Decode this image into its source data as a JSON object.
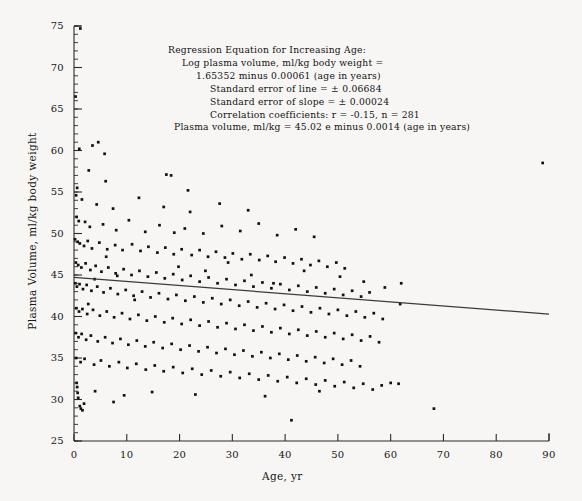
{
  "chart_data": {
    "type": "scatter",
    "title": "",
    "xlabel": "Age, yr",
    "ylabel": "Plasma Volume, ml/kg body weight",
    "xlim": [
      0,
      90
    ],
    "ylim": [
      25,
      75
    ],
    "xticks": [
      0,
      10,
      20,
      30,
      40,
      50,
      60,
      70,
      80,
      90
    ],
    "yticks": [
      25,
      30,
      35,
      40,
      45,
      50,
      55,
      60,
      65,
      70,
      75
    ],
    "grid": false,
    "legend": "none",
    "marker": "filled-square-dot",
    "marker_color": "#111111",
    "n_points_stated": 281,
    "annotations": [
      "Regression Equation for Increasing Age:",
      "Log plasma volume, ml/kg body weight =",
      "1.65352 minus 0.00061 (age in years)",
      "Standard error of line = ± 0.06684",
      "Standard error of slope = ± 0.00024",
      "Correlation coefficients:  r = -0.15, n = 281",
      "Plasma volume, ml/kg = 45.02 e minus 0.0014 (age in years)"
    ],
    "regression_line": {
      "label": "fitted regression line",
      "color": "#3b3b3b",
      "x": [
        0,
        90
      ],
      "y": [
        44.7,
        40.3
      ]
    },
    "points": [
      [
        1.2,
        74.7
      ],
      [
        0.3,
        66.5
      ],
      [
        1.0,
        60.2
      ],
      [
        3.5,
        60.6
      ],
      [
        4.6,
        61.0
      ],
      [
        5.8,
        59.6
      ],
      [
        88.8,
        58.5
      ],
      [
        2.8,
        57.6
      ],
      [
        6.0,
        56.3
      ],
      [
        17.5,
        57.1
      ],
      [
        18.4,
        57.0
      ],
      [
        21.6,
        55.2
      ],
      [
        0.6,
        55.5
      ],
      [
        0.4,
        54.6
      ],
      [
        1.5,
        54.1
      ],
      [
        4.3,
        53.5
      ],
      [
        7.4,
        53.0
      ],
      [
        12.3,
        54.3
      ],
      [
        17.0,
        53.2
      ],
      [
        22.0,
        52.6
      ],
      [
        27.6,
        53.6
      ],
      [
        33.0,
        52.8
      ],
      [
        0.5,
        52.0
      ],
      [
        0.9,
        51.5
      ],
      [
        2.1,
        51.4
      ],
      [
        3.0,
        50.8
      ],
      [
        5.5,
        51.1
      ],
      [
        8.0,
        50.4
      ],
      [
        10.4,
        51.6
      ],
      [
        13.5,
        50.2
      ],
      [
        16.2,
        51.0
      ],
      [
        19.0,
        50.1
      ],
      [
        21.0,
        50.6
      ],
      [
        24.5,
        50.0
      ],
      [
        28.0,
        50.9
      ],
      [
        31.5,
        50.3
      ],
      [
        35.0,
        51.2
      ],
      [
        38.5,
        49.8
      ],
      [
        42.0,
        50.5
      ],
      [
        45.5,
        49.6
      ],
      [
        0.2,
        49.3
      ],
      [
        0.7,
        49.0
      ],
      [
        1.1,
        48.8
      ],
      [
        1.9,
        48.5
      ],
      [
        2.6,
        49.1
      ],
      [
        3.4,
        48.2
      ],
      [
        4.8,
        48.9
      ],
      [
        6.3,
        48.1
      ],
      [
        7.8,
        48.6
      ],
      [
        9.2,
        48.0
      ],
      [
        11.0,
        48.7
      ],
      [
        12.6,
        47.9
      ],
      [
        14.1,
        48.4
      ],
      [
        15.8,
        47.7
      ],
      [
        17.3,
        48.3
      ],
      [
        18.9,
        47.5
      ],
      [
        20.4,
        48.1
      ],
      [
        22.3,
        47.4
      ],
      [
        23.8,
        48.0
      ],
      [
        25.4,
        47.2
      ],
      [
        26.9,
        47.8
      ],
      [
        28.6,
        47.1
      ],
      [
        30.1,
        47.6
      ],
      [
        31.8,
        46.9
      ],
      [
        33.4,
        47.5
      ],
      [
        35.1,
        46.8
      ],
      [
        36.7,
        47.3
      ],
      [
        38.2,
        46.6
      ],
      [
        39.9,
        47.1
      ],
      [
        41.5,
        46.4
      ],
      [
        43.1,
        46.9
      ],
      [
        44.8,
        46.2
      ],
      [
        46.4,
        46.7
      ],
      [
        48.0,
        46.0
      ],
      [
        49.7,
        46.5
      ],
      [
        51.3,
        45.8
      ],
      [
        0.35,
        46.5
      ],
      [
        0.8,
        46.2
      ],
      [
        1.4,
        45.9
      ],
      [
        2.2,
        46.4
      ],
      [
        3.1,
        45.6
      ],
      [
        4.1,
        46.1
      ],
      [
        5.2,
        45.4
      ],
      [
        6.5,
        45.9
      ],
      [
        7.9,
        45.2
      ],
      [
        9.4,
        45.7
      ],
      [
        10.9,
        45.0
      ],
      [
        12.4,
        45.5
      ],
      [
        14.0,
        44.8
      ],
      [
        15.6,
        45.3
      ],
      [
        17.2,
        44.6
      ],
      [
        18.8,
        45.1
      ],
      [
        20.5,
        44.4
      ],
      [
        22.1,
        44.9
      ],
      [
        23.8,
        44.2
      ],
      [
        25.5,
        44.7
      ],
      [
        27.2,
        44.0
      ],
      [
        28.9,
        44.5
      ],
      [
        30.6,
        43.8
      ],
      [
        32.3,
        44.3
      ],
      [
        34.0,
        43.6
      ],
      [
        35.7,
        44.1
      ],
      [
        37.4,
        43.4
      ],
      [
        39.1,
        43.9
      ],
      [
        40.8,
        43.2
      ],
      [
        42.5,
        43.7
      ],
      [
        44.2,
        43.0
      ],
      [
        45.9,
        43.5
      ],
      [
        47.6,
        42.8
      ],
      [
        49.3,
        43.3
      ],
      [
        51.0,
        42.6
      ],
      [
        52.7,
        43.1
      ],
      [
        54.4,
        42.4
      ],
      [
        56.0,
        42.9
      ],
      [
        0.25,
        44.0
      ],
      [
        0.55,
        43.6
      ],
      [
        1.05,
        43.9
      ],
      [
        1.7,
        43.3
      ],
      [
        2.4,
        43.8
      ],
      [
        3.3,
        43.1
      ],
      [
        4.4,
        43.6
      ],
      [
        5.6,
        42.9
      ],
      [
        6.9,
        43.4
      ],
      [
        8.3,
        42.7
      ],
      [
        9.8,
        43.2
      ],
      [
        11.3,
        42.5
      ],
      [
        12.9,
        43.0
      ],
      [
        14.5,
        42.3
      ],
      [
        16.1,
        42.8
      ],
      [
        17.8,
        42.1
      ],
      [
        19.4,
        42.6
      ],
      [
        21.1,
        41.9
      ],
      [
        22.8,
        42.4
      ],
      [
        24.5,
        41.7
      ],
      [
        26.2,
        42.2
      ],
      [
        27.9,
        41.5
      ],
      [
        29.6,
        42.0
      ],
      [
        31.3,
        41.3
      ],
      [
        33.0,
        41.8
      ],
      [
        34.7,
        41.1
      ],
      [
        36.4,
        41.6
      ],
      [
        38.1,
        40.9
      ],
      [
        39.8,
        41.4
      ],
      [
        41.5,
        40.7
      ],
      [
        43.2,
        41.2
      ],
      [
        44.9,
        40.5
      ],
      [
        46.6,
        41.0
      ],
      [
        48.3,
        40.3
      ],
      [
        50.0,
        40.8
      ],
      [
        51.7,
        40.1
      ],
      [
        53.4,
        40.6
      ],
      [
        55.1,
        39.9
      ],
      [
        56.8,
        40.4
      ],
      [
        58.5,
        39.7
      ],
      [
        0.45,
        41.0
      ],
      [
        0.95,
        40.6
      ],
      [
        1.6,
        40.9
      ],
      [
        2.5,
        40.3
      ],
      [
        3.6,
        40.8
      ],
      [
        4.9,
        40.1
      ],
      [
        6.2,
        40.6
      ],
      [
        7.6,
        39.9
      ],
      [
        9.1,
        40.4
      ],
      [
        10.6,
        39.7
      ],
      [
        12.2,
        40.2
      ],
      [
        13.8,
        39.5
      ],
      [
        15.4,
        40.0
      ],
      [
        17.1,
        39.3
      ],
      [
        18.7,
        39.8
      ],
      [
        20.4,
        39.1
      ],
      [
        22.1,
        39.6
      ],
      [
        23.8,
        38.9
      ],
      [
        25.5,
        39.4
      ],
      [
        27.2,
        38.7
      ],
      [
        28.9,
        39.2
      ],
      [
        30.6,
        38.5
      ],
      [
        32.3,
        39.0
      ],
      [
        34.0,
        38.3
      ],
      [
        35.7,
        38.8
      ],
      [
        37.4,
        38.1
      ],
      [
        39.1,
        38.6
      ],
      [
        40.8,
        37.9
      ],
      [
        42.5,
        38.4
      ],
      [
        44.2,
        37.7
      ],
      [
        45.9,
        38.2
      ],
      [
        47.6,
        37.5
      ],
      [
        49.3,
        38.0
      ],
      [
        51.0,
        37.3
      ],
      [
        52.7,
        37.8
      ],
      [
        54.4,
        37.1
      ],
      [
        56.1,
        37.6
      ],
      [
        57.8,
        36.9
      ],
      [
        0.3,
        38.0
      ],
      [
        0.85,
        37.5
      ],
      [
        1.45,
        37.9
      ],
      [
        2.3,
        37.2
      ],
      [
        3.2,
        37.7
      ],
      [
        4.5,
        37.0
      ],
      [
        5.9,
        37.5
      ],
      [
        7.3,
        36.8
      ],
      [
        8.8,
        37.3
      ],
      [
        10.3,
        36.6
      ],
      [
        11.9,
        37.1
      ],
      [
        13.5,
        36.4
      ],
      [
        15.1,
        36.9
      ],
      [
        16.8,
        36.2
      ],
      [
        18.5,
        36.7
      ],
      [
        20.2,
        36.0
      ],
      [
        21.9,
        36.5
      ],
      [
        23.6,
        35.8
      ],
      [
        25.3,
        36.3
      ],
      [
        27.0,
        35.6
      ],
      [
        28.7,
        36.1
      ],
      [
        30.4,
        35.4
      ],
      [
        32.1,
        35.9
      ],
      [
        33.8,
        35.2
      ],
      [
        35.5,
        35.7
      ],
      [
        37.2,
        35.0
      ],
      [
        38.9,
        35.5
      ],
      [
        40.6,
        34.8
      ],
      [
        42.3,
        35.3
      ],
      [
        44.0,
        34.6
      ],
      [
        45.7,
        35.1
      ],
      [
        47.4,
        34.4
      ],
      [
        49.1,
        34.9
      ],
      [
        50.8,
        34.2
      ],
      [
        52.5,
        34.7
      ],
      [
        54.2,
        34.0
      ],
      [
        0.4,
        35.0
      ],
      [
        1.25,
        34.5
      ],
      [
        2.0,
        34.9
      ],
      [
        3.8,
        34.2
      ],
      [
        5.1,
        34.7
      ],
      [
        6.7,
        34.0
      ],
      [
        8.5,
        34.5
      ],
      [
        10.1,
        33.8
      ],
      [
        11.8,
        34.3
      ],
      [
        13.6,
        33.6
      ],
      [
        15.3,
        34.1
      ],
      [
        17.0,
        33.4
      ],
      [
        18.8,
        33.9
      ],
      [
        20.6,
        33.2
      ],
      [
        22.4,
        33.7
      ],
      [
        24.2,
        33.0
      ],
      [
        26.0,
        33.5
      ],
      [
        27.8,
        32.8
      ],
      [
        29.6,
        33.3
      ],
      [
        31.4,
        32.6
      ],
      [
        33.2,
        33.1
      ],
      [
        35.0,
        32.4
      ],
      [
        36.8,
        32.9
      ],
      [
        38.6,
        32.2
      ],
      [
        40.4,
        32.7
      ],
      [
        42.2,
        32.0
      ],
      [
        44.0,
        32.5
      ],
      [
        45.8,
        31.8
      ],
      [
        47.6,
        32.3
      ],
      [
        49.4,
        31.6
      ],
      [
        51.2,
        32.1
      ],
      [
        53.0,
        31.4
      ],
      [
        54.8,
        31.9
      ],
      [
        56.6,
        31.2
      ],
      [
        58.3,
        31.7
      ],
      [
        60.0,
        32.0
      ],
      [
        0.5,
        32.0
      ],
      [
        0.6,
        31.5
      ],
      [
        0.7,
        30.8
      ],
      [
        0.8,
        30.2
      ],
      [
        1.1,
        29.2
      ],
      [
        1.3,
        28.9
      ],
      [
        1.6,
        28.7
      ],
      [
        1.9,
        29.5
      ],
      [
        4.0,
        31.0
      ],
      [
        7.5,
        29.7
      ],
      [
        9.5,
        30.5
      ],
      [
        14.8,
        30.9
      ],
      [
        23.0,
        30.6
      ],
      [
        36.2,
        30.4
      ],
      [
        41.2,
        27.5
      ],
      [
        46.5,
        31.0
      ],
      [
        61.5,
        31.9
      ],
      [
        68.2,
        28.9
      ],
      [
        2.7,
        41.5
      ],
      [
        3.9,
        44.5
      ],
      [
        6.1,
        47.2
      ],
      [
        8.2,
        44.9
      ],
      [
        11.5,
        42.0
      ],
      [
        19.8,
        46.0
      ],
      [
        24.9,
        45.5
      ],
      [
        29.2,
        46.5
      ],
      [
        33.6,
        45.0
      ],
      [
        37.8,
        44.0
      ],
      [
        43.6,
        45.5
      ],
      [
        50.4,
        44.8
      ],
      [
        54.9,
        44.2
      ],
      [
        58.9,
        43.5
      ],
      [
        61.8,
        41.5
      ],
      [
        62.0,
        44.0
      ]
    ]
  }
}
